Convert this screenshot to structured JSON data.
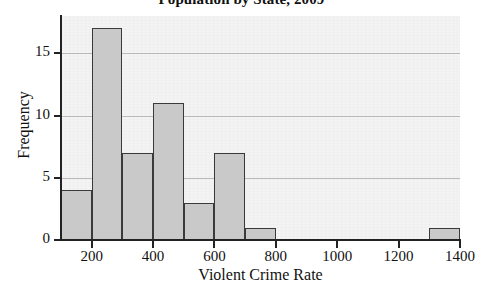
{
  "chart_data": {
    "type": "bar",
    "title": "Population by State, 2009",
    "xlabel": "Violent Crime Rate",
    "ylabel": "Frequency",
    "subtype": "histogram",
    "bin_width": 100,
    "xlim": [
      100,
      1400
    ],
    "ylim": [
      0,
      18
    ],
    "grid": true,
    "legend": null,
    "xticks": [
      200,
      400,
      600,
      800,
      1000,
      1200,
      1400
    ],
    "xtick_labels": [
      "200",
      "400",
      "600",
      "800",
      "1000",
      "1200",
      "1400"
    ],
    "yticks": [
      0,
      5,
      10,
      15
    ],
    "ytick_labels": [
      "0",
      "5",
      "10",
      "15"
    ],
    "bin_edges": [
      100,
      200,
      300,
      400,
      500,
      600,
      700,
      800,
      900,
      1000,
      1100,
      1200,
      1300,
      1400
    ],
    "categories": [
      "100-200",
      "200-300",
      "300-400",
      "400-500",
      "500-600",
      "600-700",
      "700-800",
      "800-900",
      "900-1000",
      "1000-1100",
      "1100-1200",
      "1200-1300",
      "1300-1400"
    ],
    "values": [
      4,
      17,
      7,
      11,
      3,
      7,
      1,
      0,
      0,
      0,
      0,
      0,
      1
    ],
    "bar_fill_color": "#c9c9c9",
    "bar_edge_color": "#3a3a3a",
    "plot_background_color": "#f3f3f3",
    "gridline_color": "#b9b9b9",
    "axis_color": "#222222"
  }
}
